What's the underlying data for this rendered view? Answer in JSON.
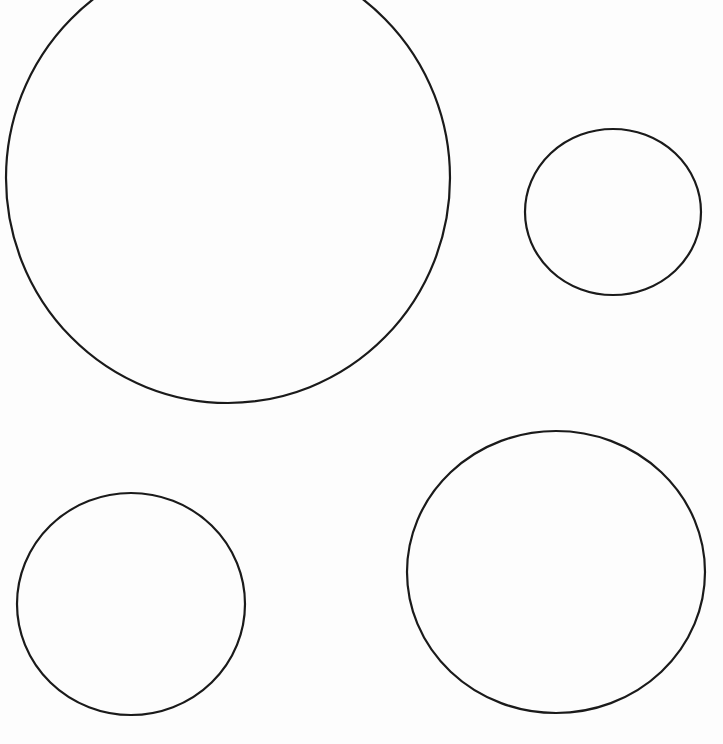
{
  "page": {
    "width": 723,
    "height": 744,
    "background": "#fdfdfd"
  },
  "diagram": {
    "stroke_color": "#1a1a1a",
    "stroke_width": 2.2,
    "fill": "none",
    "shapes": [
      {
        "id": "circle-large-top-left",
        "type": "ellipse",
        "cx": 228,
        "cy": 178,
        "rx": 222,
        "ry": 225
      },
      {
        "id": "circle-small-top-right",
        "type": "ellipse",
        "cx": 613,
        "cy": 212,
        "rx": 88,
        "ry": 83
      },
      {
        "id": "circle-medium-bottom-left",
        "type": "ellipse",
        "cx": 131,
        "cy": 604,
        "rx": 114,
        "ry": 111
      },
      {
        "id": "circle-large-bottom-right",
        "type": "ellipse",
        "cx": 556,
        "cy": 572,
        "rx": 149,
        "ry": 141
      }
    ]
  }
}
